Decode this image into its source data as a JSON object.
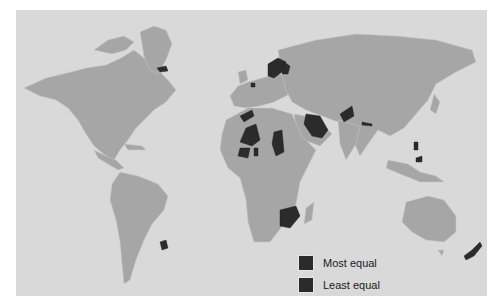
{
  "map": {
    "background_color": "#d9d9d9",
    "land_color": "#a6a6a6",
    "highlight_color": "#2b2b2b",
    "highlighted_regions": [
      "Iceland",
      "Norway",
      "Sweden",
      "Finland",
      "Denmark",
      "Baltic states",
      "Western Sahara",
      "Mali",
      "Niger",
      "Chad",
      "Burkina Faso",
      "Guinea",
      "Saudi Arabia",
      "Yemen",
      "Pakistan",
      "Nepal",
      "Philippines",
      "Indonesia (Sulawesi)",
      "South Africa",
      "Uruguay",
      "New Zealand"
    ]
  },
  "legend": {
    "items": [
      {
        "label": "Most equal",
        "color": "#2b2b2b"
      },
      {
        "label": "Least equal",
        "color": "#2b2b2b"
      }
    ]
  }
}
